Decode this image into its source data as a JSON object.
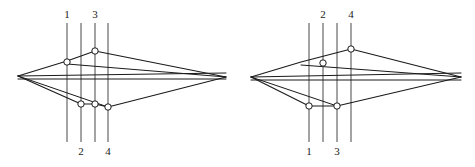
{
  "figure": {
    "title": "",
    "background": "#ffffff",
    "stroke_color": "#1a1a1a",
    "marker_fill": "#ffffff",
    "width": 475,
    "height": 167
  },
  "panels": [
    {
      "id": "left-panel",
      "name": "polygon-figure-left",
      "apex_left": {
        "x": 18,
        "y": 76
      },
      "apex_right": {
        "x": 226,
        "y": 77
      },
      "upper_chain": [
        {
          "x": 18,
          "y": 76
        },
        {
          "x": 67,
          "y": 61
        },
        {
          "x": 95,
          "y": 51
        },
        {
          "x": 226,
          "y": 77
        }
      ],
      "lower_chain": [
        {
          "x": 18,
          "y": 76
        },
        {
          "x": 81,
          "y": 104
        },
        {
          "x": 95,
          "y": 104
        },
        {
          "x": 108,
          "y": 107
        },
        {
          "x": 226,
          "y": 77
        }
      ],
      "inner_chords": [
        [
          {
            "x": 18,
            "y": 76
          },
          {
            "x": 226,
            "y": 73
          }
        ],
        [
          {
            "x": 18,
            "y": 79
          },
          {
            "x": 226,
            "y": 79
          }
        ],
        [
          {
            "x": 67,
            "y": 64
          },
          {
            "x": 226,
            "y": 77
          }
        ],
        [
          {
            "x": 18,
            "y": 76
          },
          {
            "x": 108,
            "y": 107
          }
        ]
      ],
      "sweep_lines": [
        {
          "id": "line-1",
          "x": 67,
          "label": "1",
          "label_pos": "top",
          "y_top": 23,
          "y_bottom": 142
        },
        {
          "id": "line-2",
          "x": 81,
          "label": "2",
          "label_pos": "bottom",
          "y_top": 23,
          "y_bottom": 142
        },
        {
          "id": "line-3",
          "x": 95,
          "label": "3",
          "label_pos": "top",
          "y_top": 23,
          "y_bottom": 142
        },
        {
          "id": "line-4",
          "x": 108,
          "label": "4",
          "label_pos": "bottom",
          "y_top": 23,
          "y_bottom": 142
        }
      ],
      "markers": [
        {
          "id": "m-upper-1",
          "x": 67,
          "y": 62,
          "shape": "circle"
        },
        {
          "id": "m-upper-2",
          "x": 95,
          "y": 51,
          "shape": "circle"
        },
        {
          "id": "m-lower-1",
          "x": 81,
          "y": 104,
          "shape": "circle"
        },
        {
          "id": "m-lower-2",
          "x": 95,
          "y": 104,
          "shape": "circle"
        },
        {
          "id": "m-lower-3",
          "x": 108,
          "y": 107,
          "shape": "circle"
        }
      ],
      "label_top_y": 18,
      "label_bottom_y": 155
    },
    {
      "id": "right-panel",
      "name": "polygon-figure-right",
      "apex_left": {
        "x": 251,
        "y": 77
      },
      "apex_right": {
        "x": 461,
        "y": 77
      },
      "upper_chain": [
        {
          "x": 251,
          "y": 77
        },
        {
          "x": 301,
          "y": 62
        },
        {
          "x": 351,
          "y": 49
        },
        {
          "x": 461,
          "y": 77
        }
      ],
      "lower_chain": [
        {
          "x": 251,
          "y": 77
        },
        {
          "x": 309,
          "y": 106
        },
        {
          "x": 337,
          "y": 106
        },
        {
          "x": 461,
          "y": 77
        }
      ],
      "inner_chords": [
        [
          {
            "x": 251,
            "y": 77
          },
          {
            "x": 461,
            "y": 73
          }
        ],
        [
          {
            "x": 251,
            "y": 80
          },
          {
            "x": 461,
            "y": 80
          }
        ],
        [
          {
            "x": 301,
            "y": 65
          },
          {
            "x": 461,
            "y": 77
          }
        ],
        [
          {
            "x": 251,
            "y": 77
          },
          {
            "x": 337,
            "y": 106
          }
        ]
      ],
      "sweep_lines": [
        {
          "id": "line-1",
          "x": 309,
          "label": "1",
          "label_pos": "bottom",
          "y_top": 23,
          "y_bottom": 142
        },
        {
          "id": "line-2",
          "x": 323,
          "label": "2",
          "label_pos": "top",
          "y_top": 23,
          "y_bottom": 142
        },
        {
          "id": "line-3",
          "x": 337,
          "label": "3",
          "label_pos": "bottom",
          "y_top": 23,
          "y_bottom": 142
        },
        {
          "id": "line-4",
          "x": 351,
          "label": "4",
          "label_pos": "top",
          "y_top": 23,
          "y_bottom": 142
        }
      ],
      "markers": [
        {
          "id": "m-upper-1",
          "x": 323,
          "y": 63,
          "shape": "circle"
        },
        {
          "id": "m-upper-2",
          "x": 351,
          "y": 49,
          "shape": "circle"
        },
        {
          "id": "m-lower-1",
          "x": 309,
          "y": 106,
          "shape": "circle"
        },
        {
          "id": "m-lower-2",
          "x": 337,
          "y": 106,
          "shape": "circle"
        }
      ],
      "label_top_y": 18,
      "label_bottom_y": 155
    }
  ]
}
